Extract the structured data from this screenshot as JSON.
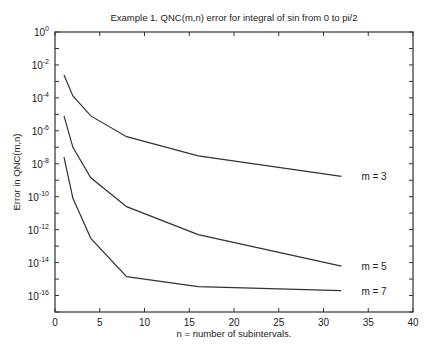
{
  "chart_data": {
    "type": "line",
    "title": "Example 1.   QNC(m,n) error for integral of sin from 0 to pi/2",
    "xlabel": "n = number of subintervals.",
    "ylabel": "Error in QNC(m,n)",
    "xlim": [
      0,
      40
    ],
    "ylim": [
      1e-17,
      1
    ],
    "yscale": "log",
    "grid": false,
    "legend_position": "inline-labels-right",
    "x_ticks": [
      0,
      5,
      10,
      15,
      20,
      25,
      30,
      35,
      40
    ],
    "y_ticks": [
      1,
      0.01,
      0.0001,
      1e-06,
      1e-08,
      1e-10,
      1e-12,
      1e-14,
      1e-16
    ],
    "y_tick_labels": [
      {
        "base": "10",
        "exp": "0"
      },
      {
        "base": "10",
        "exp": "-2"
      },
      {
        "base": "10",
        "exp": "-4"
      },
      {
        "base": "10",
        "exp": "-6"
      },
      {
        "base": "10",
        "exp": "-8"
      },
      {
        "base": "10",
        "exp": "-10"
      },
      {
        "base": "10",
        "exp": "-12"
      },
      {
        "base": "10",
        "exp": "-14"
      },
      {
        "base": "10",
        "exp": "-16"
      }
    ],
    "x": [
      1,
      2,
      4,
      8,
      16,
      32
    ],
    "series": [
      {
        "name": "m = 3",
        "values": [
          0.0025,
          0.00013,
          8e-06,
          4.4e-07,
          3e-08,
          1.7e-09
        ]
      },
      {
        "name": "m = 5",
        "values": [
          8e-06,
          1e-07,
          1.4e-09,
          2.5e-11,
          5e-13,
          6e-15
        ]
      },
      {
        "name": "m = 7",
        "values": [
          2.5e-08,
          8e-11,
          3e-13,
          1.4e-15,
          3.5e-16,
          2e-16
        ]
      }
    ]
  }
}
